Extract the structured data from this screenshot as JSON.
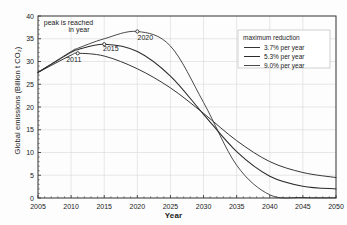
{
  "chart_data": {
    "type": "line",
    "title": "",
    "xlabel": "Year",
    "ylabel": "Global emissions (Billion t CO₂)",
    "xlim": [
      2005,
      2050
    ],
    "ylim": [
      0,
      40
    ],
    "xticks": [
      2005,
      2010,
      2015,
      2020,
      2025,
      2030,
      2035,
      2040,
      2045,
      2050
    ],
    "yticks": [
      0,
      5,
      10,
      15,
      20,
      25,
      30,
      35,
      40
    ],
    "grid": true,
    "legend_position": "top-right",
    "legend_title": "maximum reduction",
    "series": [
      {
        "name": "3.7% per year",
        "peak_year": 2011,
        "peak_value": 31.8,
        "x": [
          2005,
          2010,
          2011,
          2015,
          2020,
          2025,
          2030,
          2035,
          2040,
          2045,
          2050
        ],
        "values": [
          27.6,
          31.4,
          31.8,
          31.2,
          28.4,
          24.2,
          18.6,
          12.6,
          8.0,
          5.6,
          4.5
        ]
      },
      {
        "name": "5.3% per year",
        "peak_year": 2015,
        "peak_value": 33.8,
        "x": [
          2005,
          2010,
          2011,
          2015,
          2020,
          2025,
          2030,
          2035,
          2040,
          2045,
          2050
        ],
        "values": [
          27.6,
          32.0,
          32.6,
          33.8,
          32.2,
          26.8,
          18.4,
          10.2,
          4.8,
          2.6,
          2.0
        ]
      },
      {
        "name": "9.0% per year",
        "peak_year": 2020,
        "peak_value": 36.6,
        "x": [
          2005,
          2010,
          2011,
          2015,
          2020,
          2025,
          2030,
          2035,
          2040,
          2045,
          2050
        ],
        "values": [
          27.6,
          32.2,
          32.9,
          35.0,
          36.6,
          33.4,
          21.0,
          7.2,
          0.7,
          0.1,
          0.05
        ]
      }
    ],
    "annotations": [
      {
        "text": "peak is reached",
        "x": 2009.6,
        "y": 38.0
      },
      {
        "text": "in year",
        "x": 2011.2,
        "y": 36.4
      },
      {
        "text": "2011",
        "x": 2010.4,
        "y": 30.0
      },
      {
        "text": "2015",
        "x": 2016.0,
        "y": 32.4
      },
      {
        "text": "2020",
        "x": 2021.2,
        "y": 34.8
      }
    ],
    "markers": [
      {
        "label": "2011",
        "x": 2011,
        "y": 31.8
      },
      {
        "label": "2015",
        "x": 2015,
        "y": 33.8
      },
      {
        "label": "2020",
        "x": 2020,
        "y": 36.6
      }
    ],
    "colors": {
      "line": "#2b2b2b",
      "grid": "#d8d8d8",
      "axis": "#3a3a3a",
      "background": "#fdfdfd",
      "text": "#1a1a1a"
    }
  }
}
